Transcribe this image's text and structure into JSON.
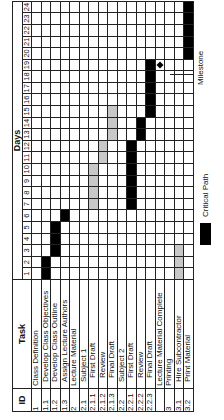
{
  "chart_data": {
    "type": "gantt",
    "title": "",
    "orientation_note": "rotated 90 degrees counter-clockwise",
    "columns": {
      "id": "ID",
      "task": "Task",
      "timeline": "Days"
    },
    "days": [
      1,
      2,
      3,
      4,
      5,
      6,
      7,
      8,
      9,
      10,
      11,
      12,
      13,
      14,
      15,
      16,
      17,
      18,
      19,
      20,
      21,
      22,
      23,
      24
    ],
    "tasks": [
      {
        "id": "1",
        "name": "Class Definition",
        "level": 1,
        "start": null,
        "end": null,
        "critical": false
      },
      {
        "id": "1.1",
        "name": "Develop Class Objectives",
        "level": 2,
        "start": 1,
        "end": 2,
        "critical": true
      },
      {
        "id": "1.2",
        "name": "Develop Class Outline",
        "level": 2,
        "start": 3,
        "end": 5,
        "critical": true
      },
      {
        "id": "1.3",
        "name": "Assign Lecture Authors",
        "level": 2,
        "start": 6,
        "end": 6,
        "critical": true
      },
      {
        "id": "2",
        "name": "Lecture Material",
        "level": 1,
        "start": null,
        "end": null,
        "critical": false
      },
      {
        "id": "2.1",
        "name": "Subject 1",
        "level": 2,
        "start": null,
        "end": null,
        "critical": false
      },
      {
        "id": "2.1.1",
        "name": "First Draft",
        "level": 3,
        "start": 7,
        "end": 10,
        "critical": false
      },
      {
        "id": "2.1.2",
        "name": "Review",
        "level": 3,
        "start": 11,
        "end": 12,
        "critical": false
      },
      {
        "id": "2.1.3",
        "name": "Final Draft",
        "level": 3,
        "start": 13,
        "end": 15,
        "critical": false
      },
      {
        "id": "2.2",
        "name": "Subject 2",
        "level": 2,
        "start": null,
        "end": null,
        "critical": false
      },
      {
        "id": "2.2.1",
        "name": "First Draft",
        "level": 3,
        "start": 7,
        "end": 12,
        "critical": true
      },
      {
        "id": "2.2.2",
        "name": "Review",
        "level": 3,
        "start": 13,
        "end": 14,
        "critical": true
      },
      {
        "id": "2.2.3",
        "name": "Final Draft",
        "level": 3,
        "start": 15,
        "end": 19,
        "critical": true
      },
      {
        "id": "",
        "name": "Lecture Material Complete",
        "level": 1,
        "start": 19,
        "end": 19,
        "critical": false,
        "milestone": true
      },
      {
        "id": "3",
        "name": "Printing",
        "level": 1,
        "start": null,
        "end": null,
        "critical": false
      },
      {
        "id": "3.1",
        "name": "Hire Subcontractor",
        "level": 2,
        "start": 1,
        "end": 3,
        "critical": false
      },
      {
        "id": "3.2",
        "name": "Print Material",
        "level": 2,
        "start": 20,
        "end": 24,
        "critical": true
      }
    ],
    "legend": [
      {
        "label": "Critical Path",
        "color": "#000000"
      },
      {
        "label": "Milestone",
        "marker": "diamond"
      }
    ],
    "colors": {
      "critical": "#000000",
      "noncritical": "#c8c8c8"
    }
  },
  "legend": {
    "critical_label": "Critical Path",
    "milestone_label": "Milestone"
  }
}
